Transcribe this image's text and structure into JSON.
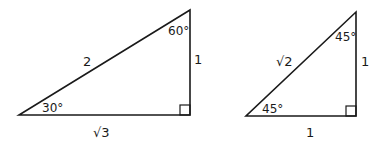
{
  "diagram": {
    "triangles": [
      {
        "name": "30-60-90",
        "angles": {
          "bottom_left": "30°",
          "top": "60°",
          "right": "right-angle"
        },
        "sides": {
          "hypotenuse": "2",
          "vertical": "1",
          "base": "√3"
        },
        "sqrt_symbol": "√",
        "sqrt_value": "3"
      },
      {
        "name": "45-45-90",
        "angles": {
          "bottom_left": "45°",
          "top": "45°",
          "right": "right-angle"
        },
        "sides": {
          "hypotenuse": "√2",
          "vertical": "1",
          "base": "1"
        },
        "sqrt_symbol": "√",
        "sqrt_value": "2"
      }
    ]
  }
}
